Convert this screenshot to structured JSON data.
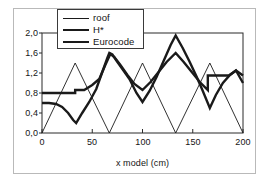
{
  "chart_data": {
    "type": "line",
    "title": "",
    "xlabel": "x model (cm)",
    "ylabel": "",
    "xlim": [
      0,
      200
    ],
    "ylim": [
      0.0,
      2.0
    ],
    "xticks": [
      "0",
      "50",
      "100",
      "150",
      "200"
    ],
    "xtick_values": [
      0,
      50,
      100,
      150,
      200
    ],
    "yticks": [
      "0,0",
      "0,4",
      "0,8",
      "1,2",
      "1,6",
      "2,0"
    ],
    "ytick_values": [
      0.0,
      0.4,
      0.8,
      1.2,
      1.6,
      2.0
    ],
    "grid": false,
    "legend_position": "top-center",
    "series": [
      {
        "name": "roof",
        "style": "thin",
        "color": "#1a1a1a",
        "points": [
          [
            0,
            0.0
          ],
          [
            33,
            1.4
          ],
          [
            67,
            0.0
          ],
          [
            100,
            1.4
          ],
          [
            133,
            0.0
          ],
          [
            167,
            1.4
          ],
          [
            200,
            0.0
          ]
        ]
      },
      {
        "name": "H*",
        "style": "thick",
        "color": "#1a1a1a",
        "points": [
          [
            0,
            0.6
          ],
          [
            7,
            0.6
          ],
          [
            14,
            0.58
          ],
          [
            20,
            0.52
          ],
          [
            26,
            0.4
          ],
          [
            31,
            0.26
          ],
          [
            34,
            0.2
          ],
          [
            40,
            0.4
          ],
          [
            47,
            0.62
          ],
          [
            54,
            0.88
          ],
          [
            60,
            1.22
          ],
          [
            65,
            1.5
          ],
          [
            67,
            1.6
          ],
          [
            70,
            1.57
          ],
          [
            74,
            1.45
          ],
          [
            80,
            1.28
          ],
          [
            87,
            1.08
          ],
          [
            94,
            0.8
          ],
          [
            100,
            0.62
          ],
          [
            107,
            0.84
          ],
          [
            114,
            1.12
          ],
          [
            121,
            1.44
          ],
          [
            128,
            1.76
          ],
          [
            133,
            1.95
          ],
          [
            140,
            1.7
          ],
          [
            147,
            1.42
          ],
          [
            154,
            1.12
          ],
          [
            160,
            0.84
          ],
          [
            167,
            0.5
          ],
          [
            173,
            0.76
          ],
          [
            180,
            1.0
          ],
          [
            187,
            1.16
          ],
          [
            193,
            1.25
          ],
          [
            200,
            1.0
          ]
        ]
      },
      {
        "name": "Eurocode",
        "style": "thick",
        "color": "#1a1a1a",
        "points": [
          [
            0,
            0.8
          ],
          [
            33,
            0.8
          ],
          [
            33,
            0.86
          ],
          [
            42,
            0.86
          ],
          [
            50,
            0.96
          ],
          [
            57,
            1.08
          ],
          [
            63,
            1.36
          ],
          [
            68,
            1.58
          ],
          [
            72,
            1.52
          ],
          [
            78,
            1.36
          ],
          [
            85,
            1.16
          ],
          [
            92,
            0.98
          ],
          [
            100,
            0.86
          ],
          [
            108,
            1.02
          ],
          [
            116,
            1.22
          ],
          [
            124,
            1.42
          ],
          [
            133,
            1.6
          ],
          [
            141,
            1.42
          ],
          [
            149,
            1.22
          ],
          [
            157,
            1.02
          ],
          [
            165,
            0.86
          ],
          [
            165,
            1.15
          ],
          [
            186,
            1.15
          ],
          [
            193,
            1.25
          ],
          [
            200,
            1.15
          ]
        ]
      }
    ]
  },
  "legend": {
    "items": [
      {
        "label": "roof",
        "style": "thin"
      },
      {
        "label": "H*",
        "style": "thick"
      },
      {
        "label": "Eurocode",
        "style": "thick"
      }
    ]
  },
  "axes": {
    "x_title": "x model (cm)"
  }
}
